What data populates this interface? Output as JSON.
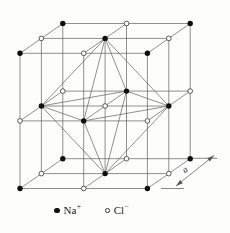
{
  "diagram": {
    "type": "crystal-lattice",
    "colors": {
      "background": "#fdfdfc",
      "line": "#555555",
      "atom_filled": "#0f0f0f",
      "atom_open_fill": "#ffffff",
      "atom_open_stroke": "#333333",
      "text": "#1b1b1b"
    },
    "lattice": {
      "grid_points_per_edge": 3,
      "origin": [
        20,
        188.5
      ],
      "step_i": [
        63.7,
        0
      ],
      "step_j": [
        0,
        -67.6
      ],
      "step_k": [
        21.4,
        -14.9
      ],
      "line_width": 0.65,
      "atom_radius_filled": 2.7,
      "atom_radius_open": 2.35,
      "open_stroke_width": 0.8,
      "filled_species": "Na+",
      "open_species": "Cl-"
    },
    "octahedron": {
      "vertices": {
        "top": [
          1,
          2,
          1
        ],
        "bottom": [
          1,
          0,
          1
        ],
        "front": [
          1,
          1,
          0
        ],
        "back": [
          1,
          1,
          2
        ],
        "left": [
          0,
          1,
          1
        ],
        "right": [
          2,
          1,
          1
        ]
      },
      "edges": [
        [
          "top",
          "front"
        ],
        [
          "top",
          "right"
        ],
        [
          "top",
          "back"
        ],
        [
          "top",
          "left"
        ],
        [
          "bottom",
          "front"
        ],
        [
          "bottom",
          "right"
        ],
        [
          "bottom",
          "back"
        ],
        [
          "bottom",
          "left"
        ],
        [
          "front",
          "right"
        ],
        [
          "right",
          "back"
        ],
        [
          "back",
          "left"
        ],
        [
          "left",
          "front"
        ]
      ]
    },
    "dimension": {
      "label": "a",
      "arrow_from": [
        176,
        186
      ],
      "arrow_to": [
        214,
        155.5
      ],
      "extension_lines": [
        [
          [
            161,
            188.5
          ],
          [
            184,
            188.5
          ]
        ],
        [
          [
            191,
            158.3
          ],
          [
            217,
            158.3
          ]
        ]
      ],
      "label_pos": [
        186.5,
        172
      ],
      "label_rotation": -35,
      "line_width": 0.7,
      "head_length": 7,
      "head_half_width": 2.2
    }
  },
  "legend": {
    "items": [
      {
        "symbol": "filled-circle",
        "label": "Na",
        "sup": "+"
      },
      {
        "symbol": "open-circle",
        "label": "Cl",
        "sup": "−"
      }
    ]
  }
}
